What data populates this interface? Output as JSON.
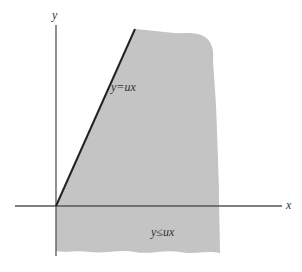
{
  "figure": {
    "axes": {
      "x_label": "x",
      "y_label": "y"
    },
    "line_label": "y=ux",
    "region_label": "y≤ux",
    "colors": {
      "region": "#c4c4c4",
      "axis": "#555555",
      "line": "#222222"
    }
  }
}
